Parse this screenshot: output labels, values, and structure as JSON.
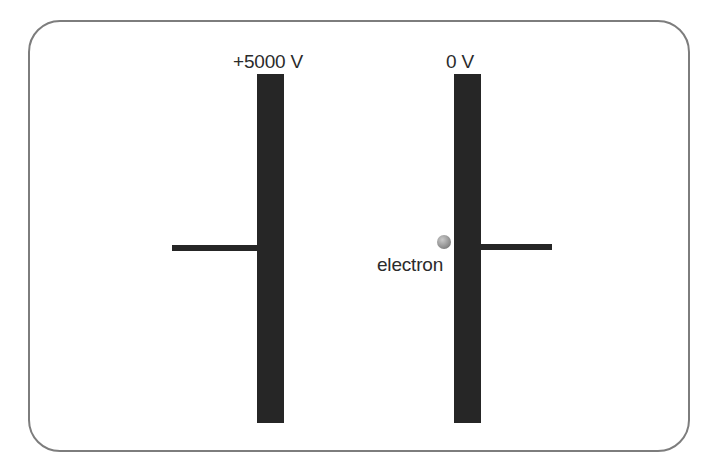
{
  "figure": {
    "background_color": "#ffffff",
    "frame": {
      "name": "rounded-border-frame",
      "stroke_color": "#7d7d7d",
      "stroke_width_px": 2.5,
      "corner_radius_px": 32
    },
    "plate_color": "#262626",
    "wire_color": "#262626",
    "text_color": "#2b2b2b"
  },
  "plates": [
    {
      "id": "left",
      "label": "+5000 V",
      "voltage_value": 5000,
      "voltage_unit": "V",
      "polarity": "positive"
    },
    {
      "id": "right",
      "label": "0 V",
      "voltage_value": 0,
      "voltage_unit": "V",
      "polarity": "ground"
    }
  ],
  "particle": {
    "label": "electron",
    "shape": "sphere",
    "fill_color": "#8e8e8e",
    "highlight_color": "#c9c9c9"
  },
  "wires": [
    {
      "id": "left-lead",
      "attached_to": "left"
    },
    {
      "id": "right-lead",
      "attached_to": "right"
    }
  ]
}
